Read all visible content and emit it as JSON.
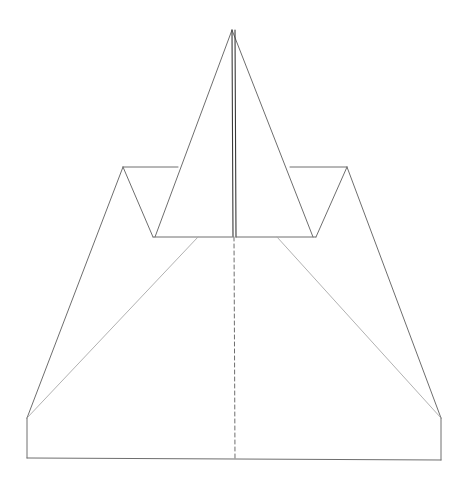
{
  "diagram": {
    "type": "folding-diagram",
    "colors": {
      "background": "#ffffff",
      "stroke": "#6e6e6e",
      "light_stroke": "#a8a8a8",
      "center_stroke": "#3a3a3a"
    },
    "apex": [
      232,
      30
    ],
    "lines": {
      "nose_left": [
        [
          232,
          30
        ],
        [
          155,
          237
        ]
      ],
      "nose_right": [
        [
          232,
          30
        ],
        [
          313,
          237
        ]
      ],
      "center_solid": [
        [
          232,
          30
        ],
        [
          233,
          237
        ]
      ],
      "center_solid_2": [
        [
          235,
          30
        ],
        [
          236,
          237
        ]
      ],
      "center_dashed": [
        [
          234,
          237
        ],
        [
          235,
          460
        ]
      ],
      "left_wing_outer": [
        [
          123,
          167
        ],
        [
          27,
          418
        ]
      ],
      "left_notch_top": [
        [
          123,
          167
        ],
        [
          178,
          167
        ]
      ],
      "left_notch_diag": [
        [
          123,
          167
        ],
        [
          153,
          237
        ]
      ],
      "left_base_edge": [
        [
          153,
          237
        ],
        [
          232,
          237
        ]
      ],
      "left_fold_diag": [
        [
          27,
          418
        ],
        [
          198,
          237
        ]
      ],
      "left_side": [
        [
          27,
          418
        ],
        [
          27,
          458
        ]
      ],
      "bottom_edge": [
        [
          27,
          458
        ],
        [
          441,
          460
        ]
      ],
      "right_wing_outer": [
        [
          347,
          167
        ],
        [
          441,
          418
        ]
      ],
      "right_notch_top": [
        [
          290,
          167
        ],
        [
          347,
          167
        ]
      ],
      "right_notch_diag": [
        [
          347,
          167
        ],
        [
          316,
          237
        ]
      ],
      "right_base_edge": [
        [
          236,
          237
        ],
        [
          316,
          237
        ]
      ],
      "right_fold_diag": [
        [
          441,
          418
        ],
        [
          277,
          237
        ]
      ],
      "right_side": [
        [
          441,
          418
        ],
        [
          441,
          460
        ]
      ]
    }
  }
}
